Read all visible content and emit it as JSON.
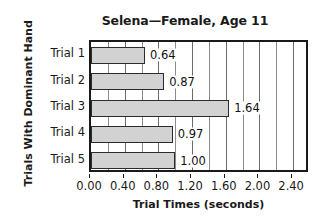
{
  "chart_data": {
    "type": "bar",
    "orientation": "horizontal",
    "title": "Selena—Female, Age 11",
    "xlabel": "Trial Times (seconds)",
    "ylabel": "Trials With Dominant Hand",
    "categories": [
      "Trial 1",
      "Trial 2",
      "Trial 3",
      "Trial 4",
      "Trial 5"
    ],
    "values": [
      0.64,
      0.87,
      1.64,
      0.97,
      1.0
    ],
    "value_labels": [
      "0.64",
      "0.87",
      "1.64",
      "0.97",
      "1.00"
    ],
    "xlim": [
      0.0,
      2.6
    ],
    "xticks": [
      0.0,
      0.4,
      0.8,
      1.2,
      1.6,
      2.0,
      2.4
    ],
    "xtick_labels": [
      "0.00",
      "0.40",
      "0.80",
      "1.20",
      "1.60",
      "2.00",
      "2.40"
    ],
    "minor_gridline_step": 0.2,
    "grid": true,
    "grid_axis": "x",
    "legend": null,
    "bar_color": "#d2d2d2",
    "bar_border_color": "#2b2b2b",
    "axis_color": "#1a1a1a",
    "gridline_color": "#8c8c8c",
    "background": "#ffffff"
  }
}
